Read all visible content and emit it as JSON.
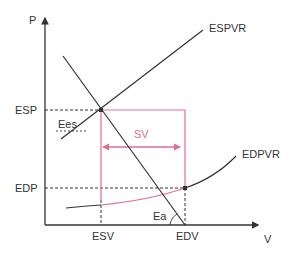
{
  "diagram": {
    "type": "pressure-volume relationship",
    "axes": {
      "y_label": "P",
      "x_label": "V"
    },
    "y_ticks": [
      "ESP",
      "EDP"
    ],
    "x_ticks": [
      "ESV",
      "EDV"
    ],
    "curves": {
      "espvr_label": "ESPVR",
      "edpvr_label": "EDPVR"
    },
    "annotations": {
      "ees_label": "Ees",
      "ea_label": "Ea",
      "sv_label": "SV"
    },
    "colors": {
      "line": "#333333",
      "accent": "#e07090",
      "background": "#ffffff"
    }
  }
}
